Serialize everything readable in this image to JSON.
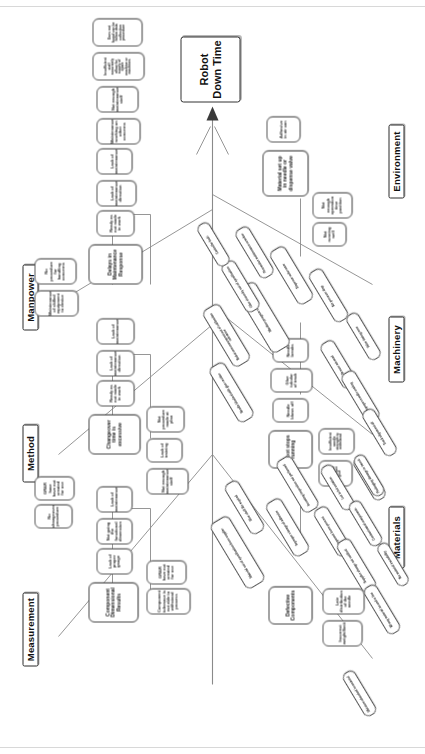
{
  "diagram": {
    "type": "fishbone-ishikawa",
    "orientation": "rotated-90-counterclockwise",
    "head": "Robot Down Time",
    "categories": [
      {
        "id": "measurement",
        "label": "Measurement"
      },
      {
        "id": "method",
        "label": "Method"
      },
      {
        "id": "manpower",
        "label": "Manpower"
      },
      {
        "id": "environment",
        "label": "Environment"
      },
      {
        "id": "machinery",
        "label": "Machinery"
      },
      {
        "id": "materials",
        "label": "Materials"
      }
    ]
  },
  "measurement": {
    "primary": "Component Dimensional Results",
    "causes": [
      "Lack of proper gauge",
      "Not going the functional dimension",
      "Lack of maintenance",
      "Component tolerance is not able to withstand process",
      "GR&R have not created for use"
    ]
  },
  "method": {
    "primary": "Changeover time is excessive",
    "causes": [
      "Ready as not made in work",
      "Lack of maintenance direction",
      "Lack of maintenance",
      "Not enough maintenance staff",
      "Lack of training",
      "Not procedure made at plan",
      "No changeover procedure",
      "GR&R have have not created for use"
    ]
  },
  "manpower": {
    "primary": "Delays in Maintenance Response",
    "causes": [
      "Ready as not made in work",
      "Lack of maintenance direction",
      "Lack of maintenance",
      "Maintenance of skilled equipment to device",
      "No procedure for handling concerns",
      "Maintenance working on other concerns",
      "Not enough maintenance staff",
      "Insufficient staff accurately allow for supply of spare machine or machines",
      "Does not found can be follow data collection procedure"
    ]
  },
  "environment": {
    "primary": "Material set up in needle or dispense valve",
    "causes": [
      "Adhesive in air can",
      "Not running well",
      "Not enough operation time position"
    ]
  },
  "machinery": {
    "primary": "Robot stops running",
    "causes": [
      "Needle blows off",
      "Glue tubular of track",
      "Needle breaks",
      "Insufficient needle strength to withstand",
      "Needle debris or improper glue",
      "Needle blocked with glue residue",
      "Robot arm movement out of calibration tolerance",
      "Machine program error",
      "Glue viscosity out of specification",
      "Dispense valve wear",
      "Air pressure drop",
      "Preventive maintenance overdue",
      "Controller fault",
      "Sensor misread",
      "Improper needle seating",
      "Valve timing error",
      "Track alignment off",
      "Worn fixture"
    ]
  },
  "materials": {
    "primary": "Defective Components",
    "causes": [
      "Incorrect weight/limit",
      "Late distribution of the needle",
      "Material out of specification from supplier",
      "Glue shelf life expired",
      "Improper storage of adhesive",
      "Incoming inspection not performed",
      "Component burrs present",
      "Lot to lot variation",
      "Supplier change not notified",
      "Contaminated components",
      "Packaging damage in transit",
      "Wrong material issued to line",
      "No material traceability",
      "Moisture absorbed in material"
    ]
  }
}
